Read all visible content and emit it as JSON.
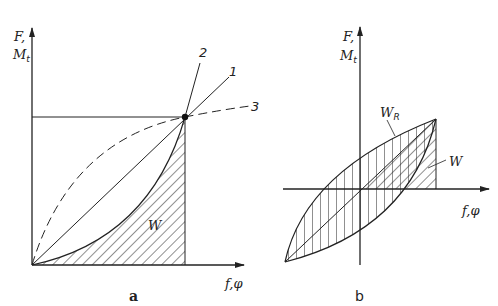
{
  "figure": {
    "panel_a": {
      "caption": "a",
      "y_axis_label_line1": "F,",
      "y_axis_label_line2": "M",
      "y_axis_label_sub": "t",
      "x_axis_label": "f,φ",
      "curve_labels": [
        "1",
        "2",
        "3"
      ],
      "area_label": "W"
    },
    "panel_b": {
      "caption": "b",
      "y_axis_label_line1": "F,",
      "y_axis_label_line2": "M",
      "y_axis_label_sub": "t",
      "x_axis_label": "f,φ",
      "hysteresis_label": "W",
      "hysteresis_label_sub": "R",
      "area_label": "W"
    },
    "line_color": "#222222",
    "background": "#ffffff"
  }
}
